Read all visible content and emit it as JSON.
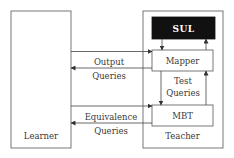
{
  "diagram": {
    "nodes": {
      "learner": {
        "label": "Learner"
      },
      "teacher": {
        "label": "Teacher"
      },
      "sul": {
        "label": "SUL",
        "fill": "#111111",
        "text_color": "#ffffff"
      },
      "mapper": {
        "label": "Mapper"
      },
      "mbt": {
        "label": "MBT"
      }
    },
    "edges": {
      "output_queries": {
        "line1": "Output",
        "line2": "Queries"
      },
      "test_queries": {
        "line1": "Test",
        "line2": "Queries"
      },
      "equivalence_queries": {
        "line1": "Equivalence",
        "line2": "Queries"
      }
    }
  }
}
